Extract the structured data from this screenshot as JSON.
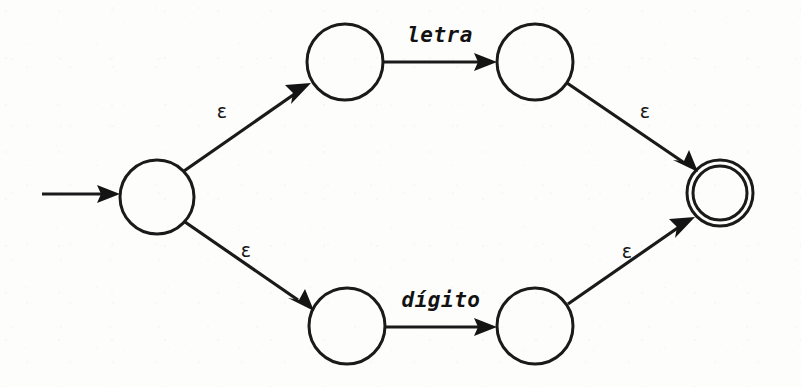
{
  "diagram": {
    "kind": "nfa-thompson-construction",
    "background_color": "#fdfdfc",
    "ink_color": "#1a1a1a",
    "canvas": {
      "width": 801,
      "height": 387
    },
    "states": [
      {
        "id": "q0",
        "role": "start",
        "label": "",
        "cx": 157,
        "cy": 197,
        "r": 37,
        "accepting": false
      },
      {
        "id": "q1",
        "role": "branch-top-left",
        "label": "",
        "cx": 345,
        "cy": 62,
        "r": 38,
        "accepting": false
      },
      {
        "id": "q2",
        "role": "branch-top-right",
        "label": "",
        "cx": 535,
        "cy": 62,
        "r": 38,
        "accepting": false
      },
      {
        "id": "q3",
        "role": "branch-bottom-left",
        "label": "",
        "cx": 347,
        "cy": 326,
        "r": 38,
        "accepting": false
      },
      {
        "id": "q4",
        "role": "branch-bottom-right",
        "label": "",
        "cx": 535,
        "cy": 326,
        "r": 38,
        "accepting": false
      },
      {
        "id": "q5",
        "role": "accept",
        "label": "",
        "cx": 720,
        "cy": 193,
        "r": 33,
        "accepting": true,
        "inner_r": 27
      }
    ],
    "start_arrow": {
      "from_x": 42,
      "from_y": 194,
      "to_x": 118,
      "to_y": 194
    },
    "transitions": [
      {
        "id": "t0",
        "from": "q0",
        "to": "q1",
        "label": "ε",
        "label_x": 222,
        "label_y": 118,
        "kind": "epsilon"
      },
      {
        "id": "t1",
        "from": "q1",
        "to": "q2",
        "label": "letra",
        "label_x": 440,
        "label_y": 42,
        "kind": "symbol"
      },
      {
        "id": "t2",
        "from": "q2",
        "to": "q5",
        "label": "ε",
        "label_x": 645,
        "label_y": 118,
        "kind": "epsilon"
      },
      {
        "id": "t3",
        "from": "q0",
        "to": "q3",
        "label": "ε",
        "label_x": 246,
        "label_y": 257,
        "kind": "epsilon"
      },
      {
        "id": "t4",
        "from": "q3",
        "to": "q4",
        "label": "dígito",
        "label_x": 441,
        "label_y": 307,
        "kind": "symbol"
      },
      {
        "id": "t5",
        "from": "q4",
        "to": "q5",
        "label": "ε",
        "label_x": 627,
        "label_y": 258,
        "kind": "epsilon"
      }
    ],
    "alphabet_labels": {
      "letra": "letra",
      "digito": "dígito",
      "epsilon": "ε"
    }
  }
}
